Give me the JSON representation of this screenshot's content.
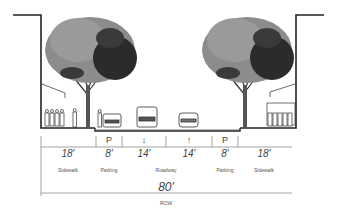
{
  "diagram": {
    "type": "street-cross-section",
    "segments": [
      {
        "name": "Sidewalk",
        "width": "18'",
        "symbol": ""
      },
      {
        "name": "Parking",
        "width": "8'",
        "symbol": "P"
      },
      {
        "name": "Roadway",
        "width": "14'",
        "symbol": "↓"
      },
      {
        "name": "Roadway",
        "width": "14'",
        "symbol": "↑"
      },
      {
        "name": "Parking",
        "width": "8'",
        "symbol": "P"
      },
      {
        "name": "Sidewalk",
        "width": "18'",
        "symbol": ""
      }
    ],
    "roadway_label": "Roadway",
    "total": {
      "width": "80'",
      "label": "ROW"
    },
    "colors": {
      "line": "#222222",
      "tree_light": "#8a8a8a",
      "tree_dark": "#2a2a2a",
      "background": "#ffffff"
    }
  }
}
